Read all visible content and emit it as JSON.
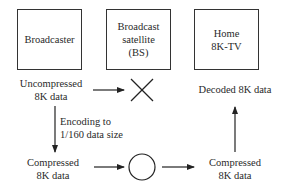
{
  "boxes": {
    "broadcaster": "Broadcaster",
    "satellite_line1": "Broadcast",
    "satellite_line2": "satellite",
    "satellite_line3": "(BS)",
    "home_line1": "Home",
    "home_line2": "8K-TV"
  },
  "labels": {
    "uncompressed_line1": "Uncompressed",
    "uncompressed_line2": "8K data",
    "encoding_line1": "Encoding to",
    "encoding_line2": "1/160 data size",
    "compressed_left_line1": "Compressed",
    "compressed_left_line2": "8K data",
    "compressed_right_line1": "Compressed",
    "compressed_right_line2": "8K data",
    "decoded": "Decoded 8K data"
  },
  "symbols": {
    "uncompressed_transmission": "x-mark (not possible)",
    "compressed_transmission": "circle (possible)"
  }
}
